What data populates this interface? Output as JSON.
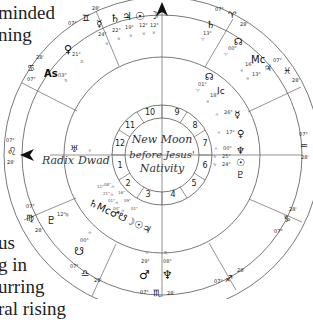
{
  "background_text": {
    "top_lines": [
      "minded",
      "ning"
    ],
    "bottom_lines": [
      "us",
      "g in",
      "urring",
      "ral rising"
    ]
  },
  "chart": {
    "center_title": [
      "New Moon",
      "before Jesus'",
      "Nativity"
    ],
    "axis_labels": {
      "left_outer": "Radix",
      "left_inner": "Dwad"
    },
    "houses": [
      "1",
      "2",
      "3",
      "4",
      "5",
      "6",
      "7",
      "8",
      "9",
      "10",
      "11",
      "12"
    ],
    "sign_cusps": [
      {
        "sign": "Leo",
        "glyph": "♌",
        "deg_a": "07°",
        "deg_b": "28'"
      },
      {
        "sign": "Cancer",
        "glyph": "♋",
        "deg_a": "28'",
        "deg_b": "07°"
      },
      {
        "sign": "Gemini",
        "glyph": "♊",
        "deg_a": "07°",
        "deg_b": "28'"
      },
      {
        "sign": "Aries",
        "glyph": "♈",
        "deg_a": "07°",
        "deg_b": "28'"
      },
      {
        "sign": "Pisces",
        "glyph": "♓",
        "deg_a": "07°",
        "deg_b": "28'"
      },
      {
        "sign": "Aquarius",
        "glyph": "♒",
        "deg_a": "07°",
        "deg_b": "28'"
      },
      {
        "sign": "Capricorn",
        "glyph": "♑",
        "deg_a": "28'",
        "deg_b": "07°"
      },
      {
        "sign": "Sagittarius",
        "glyph": "♐",
        "deg_a": "07°",
        "deg_b": "28'"
      },
      {
        "sign": "Scorpio",
        "glyph": "♏",
        "deg_a": "07°",
        "deg_b": "28'"
      },
      {
        "sign": "Libra",
        "glyph": "♎",
        "deg_a": "07°",
        "deg_b": "28'"
      },
      {
        "sign": "Virgo",
        "glyph": "♍",
        "deg_a": "07°",
        "deg_b": "28'"
      }
    ],
    "planets_top": [
      {
        "name": "Mercury",
        "glyph": "☿",
        "deg": "24°",
        "sign": "♉"
      },
      {
        "name": "Saturn-alt",
        "glyph": "♄",
        "deg": "22°",
        "sign": "♉"
      },
      {
        "name": "Jupiter",
        "glyph": "♃",
        "deg": "19°",
        "sign": "♉"
      },
      {
        "name": "Sun",
        "glyph": "☉",
        "deg": "12°",
        "sign": "♉"
      },
      {
        "name": "Moon",
        "glyph": "☽",
        "deg": "12°",
        "sign": "♉"
      }
    ],
    "planets_right_upper": [
      {
        "name": "Saturn",
        "glyph": "♄",
        "deg": "13°",
        "sign": "♈"
      },
      {
        "name": "North Node",
        "glyph": "☊",
        "deg": "00°",
        "sign": "♈"
      },
      {
        "name": "Midheaven",
        "glyph": "Mc",
        "deg": "16°",
        "sign": "♓"
      },
      {
        "name": "Jupiter-dwad",
        "glyph": "♃",
        "deg": "13°",
        "sign": "♓"
      },
      {
        "name": "Node-dwad",
        "glyph": "☊",
        "deg": "01°",
        "sign": "♈"
      },
      {
        "name": "Imum Coeli",
        "glyph": "Ic",
        "deg": "18°",
        "sign": "♓"
      }
    ],
    "planets_right": [
      {
        "name": "Mercury-dwad",
        "glyph": "☿",
        "deg": "26°",
        "sign": "♒"
      },
      {
        "name": "Venus-dwad",
        "glyph": "♀",
        "deg": "17°",
        "sign": "♒"
      },
      {
        "name": "Neptune-dwad",
        "glyph": "♆",
        "deg": "00°",
        "sign": "♒"
      },
      {
        "name": "Sun-dwad",
        "glyph": "☉",
        "deg": "25°",
        "sign": "♑"
      },
      {
        "name": "Pluto-dwad",
        "glyph": "♇",
        "deg": "24°",
        "sign": "♑"
      }
    ],
    "planets_left": [
      {
        "name": "Venus",
        "glyph": "♀",
        "deg": "21°",
        "sign": "♊"
      },
      {
        "name": "Ascendant",
        "glyph": "As",
        "deg": "03°",
        "sign": "♋"
      },
      {
        "name": "Uranus",
        "glyph": "♅",
        "deg": "",
        "sign": "♌"
      }
    ],
    "planets_bottom_left": [
      {
        "name": "Pluto",
        "glyph": "♇",
        "deg": "12°",
        "sign": "♍"
      },
      {
        "name": "South Node",
        "glyph": "☋",
        "deg": "00°",
        "sign": "♎"
      },
      {
        "name": "Cluster",
        "glyph": "♄Mc♂☋☽☉♃",
        "deg": "",
        "sign": "♎"
      }
    ],
    "planets_bottom": [
      {
        "name": "Mars",
        "glyph": "♂",
        "deg": "29°",
        "sign": "♎"
      },
      {
        "name": "Neptune",
        "glyph": "♆",
        "deg": "08°",
        "sign": "♏"
      }
    ]
  }
}
